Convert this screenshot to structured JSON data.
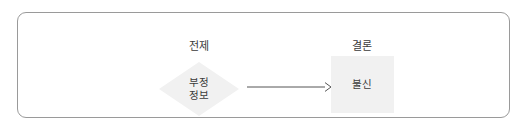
{
  "figure": {
    "name": "premise-conclusion-diagram",
    "frame": {
      "border_color": "#9a9a9a",
      "background": "#ffffff"
    },
    "columns": [
      {
        "id": "premise",
        "label": "전제"
      },
      {
        "id": "conclusion",
        "label": "결론"
      }
    ],
    "nodes": [
      {
        "id": "premise-node",
        "shape": "diamond",
        "fill": "#f1f1f1",
        "lines": [
          "부정",
          "정보"
        ]
      },
      {
        "id": "conclusion-node",
        "shape": "rectangle",
        "fill": "#f1f1f1",
        "lines": [
          "불신"
        ]
      }
    ],
    "edge": {
      "id": "premise-to-conclusion",
      "type": "arrow",
      "direction": "right",
      "color": "#555555",
      "label": ""
    }
  }
}
